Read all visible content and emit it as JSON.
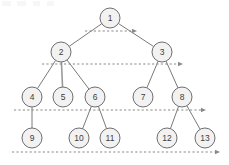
{
  "diagram": {
    "type": "binary-tree",
    "canvas": {
      "width": 229,
      "height": 165
    },
    "style": {
      "node_fill": "#f2f2f2",
      "node_stroke": "#6e6e6e",
      "label_color": "#3d3d3d",
      "edge_color": "#7a7a7a",
      "arrow_color": "#8a8a8a",
      "background": "#ffffff",
      "node_radius": 10
    },
    "nodes": [
      {
        "id": "n1",
        "label": "1",
        "cx": 110,
        "cy": 18,
        "level": 0
      },
      {
        "id": "n2",
        "label": "2",
        "cx": 61,
        "cy": 52,
        "level": 1
      },
      {
        "id": "n3",
        "label": "3",
        "cx": 162,
        "cy": 52,
        "level": 1
      },
      {
        "id": "n4",
        "label": "4",
        "cx": 32,
        "cy": 97,
        "level": 2
      },
      {
        "id": "n5",
        "label": "5",
        "cx": 63,
        "cy": 97,
        "level": 2
      },
      {
        "id": "n6",
        "label": "6",
        "cx": 95,
        "cy": 97,
        "level": 2
      },
      {
        "id": "n7",
        "label": "7",
        "cx": 143,
        "cy": 97,
        "level": 2
      },
      {
        "id": "n8",
        "label": "8",
        "cx": 182,
        "cy": 97,
        "level": 2
      },
      {
        "id": "n9",
        "label": "9",
        "cx": 32,
        "cy": 138,
        "level": 3
      },
      {
        "id": "n10",
        "label": "10",
        "cx": 79,
        "cy": 138,
        "level": 3
      },
      {
        "id": "n11",
        "label": "11",
        "cx": 110,
        "cy": 138,
        "level": 3
      },
      {
        "id": "n12",
        "label": "12",
        "cx": 167,
        "cy": 138,
        "level": 3
      },
      {
        "id": "n13",
        "label": "13",
        "cx": 205,
        "cy": 138,
        "level": 3
      }
    ],
    "edges": [
      {
        "from": "n1",
        "to": "n2",
        "thick": false
      },
      {
        "from": "n1",
        "to": "n3",
        "thick": false
      },
      {
        "from": "n2",
        "to": "n4",
        "thick": false
      },
      {
        "from": "n2",
        "to": "n5",
        "thick": true
      },
      {
        "from": "n2",
        "to": "n6",
        "thick": false
      },
      {
        "from": "n3",
        "to": "n7",
        "thick": false
      },
      {
        "from": "n3",
        "to": "n8",
        "thick": false
      },
      {
        "from": "n4",
        "to": "n9",
        "thick": false
      },
      {
        "from": "n6",
        "to": "n10",
        "thick": false
      },
      {
        "from": "n6",
        "to": "n11",
        "thick": false
      },
      {
        "from": "n8",
        "to": "n12",
        "thick": false
      },
      {
        "from": "n8",
        "to": "n13",
        "thick": false
      }
    ],
    "level_arrows": [
      {
        "id": "a0",
        "level": 0,
        "x1": 85,
        "x2": 137,
        "y": 31
      },
      {
        "id": "a1",
        "level": 1,
        "x1": 42,
        "x2": 183,
        "y": 64
      },
      {
        "id": "a2",
        "level": 2,
        "x1": 14,
        "x2": 206,
        "y": 110
      },
      {
        "id": "a3",
        "level": 3,
        "x1": 12,
        "x2": 220,
        "y": 152
      }
    ]
  }
}
